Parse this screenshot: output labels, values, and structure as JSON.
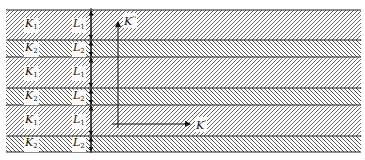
{
  "diagram": {
    "type": "layered-medium",
    "layers": [
      {
        "material": "K",
        "material_index": "1",
        "thickness": "L",
        "thickness_index": "1",
        "y": 10,
        "h": 30,
        "hatch": "forward"
      },
      {
        "material": "K",
        "material_index": "2",
        "thickness": "L",
        "thickness_index": "2",
        "y": 40,
        "h": 17,
        "hatch": "backward"
      },
      {
        "material": "K",
        "material_index": "1",
        "thickness": "L",
        "thickness_index": "1",
        "y": 57,
        "h": 31,
        "hatch": "forward"
      },
      {
        "material": "K",
        "material_index": "2",
        "thickness": "L",
        "thickness_index": "2",
        "y": 88,
        "h": 17,
        "hatch": "backward"
      },
      {
        "material": "K",
        "material_index": "1",
        "thickness": "L",
        "thickness_index": "1",
        "y": 105,
        "h": 31,
        "hatch": "forward"
      },
      {
        "material": "K",
        "material_index": "2",
        "thickness": "L",
        "thickness_index": "2",
        "y": 136,
        "h": 16,
        "hatch": "backward"
      }
    ],
    "axes": {
      "vertical": {
        "label": "K",
        "prime": "''"
      },
      "horizontal": {
        "label": "K",
        "prime": "'"
      }
    },
    "colors": {
      "line": "#222222",
      "hatch": "#555555",
      "background": "#ffffff"
    }
  }
}
